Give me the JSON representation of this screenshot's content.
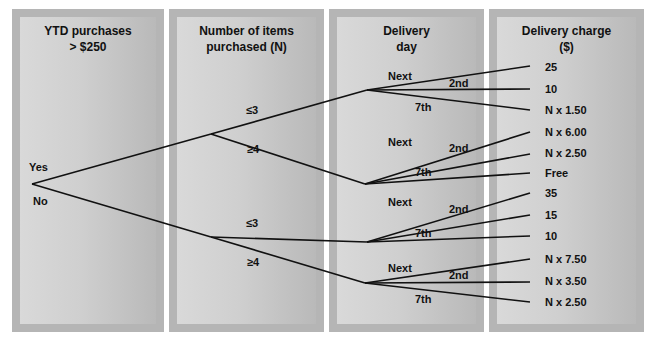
{
  "columns": [
    {
      "title": "YTD purchases\n> $250"
    },
    {
      "title": "Number of items\npurchased (N)"
    },
    {
      "title": "Delivery\nday"
    },
    {
      "title": "Delivery charge\n($)"
    }
  ],
  "root": {
    "branches": [
      "Yes",
      "No"
    ]
  },
  "items_branches": {
    "yes": [
      "≤3",
      "≥4"
    ],
    "no": [
      "≤3",
      "≥4"
    ]
  },
  "delivery_labels": {
    "next": "Next",
    "second": "2nd",
    "seventh": "7th"
  },
  "charges": {
    "yes_le3": [
      "25",
      "10",
      "N x 1.50"
    ],
    "yes_ge4": [
      "N x 6.00",
      "N x 2.50",
      "Free"
    ],
    "no_le3": [
      "35",
      "15",
      "10"
    ],
    "no_ge4": [
      "N x 7.50",
      "N x 3.50",
      "N x 2.50"
    ]
  },
  "colors": {
    "panel_frame": "#b5b5b5",
    "panel_inner": "#d0d0d0",
    "line": "#111111"
  }
}
